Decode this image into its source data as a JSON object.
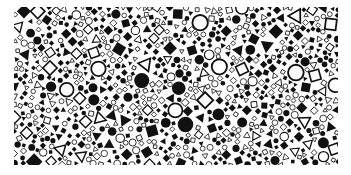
{
  "image": {
    "description": "Dense random mosaic of black geometric shapes: filled and outlined squares, circles, diamonds and triangles on white",
    "background": "#ffffff",
    "ink": "#111111",
    "area": {
      "x": 14,
      "y": 7,
      "width": 324,
      "height": 158
    },
    "shapes": [
      "square",
      "diamond",
      "circle",
      "triangle"
    ],
    "styles": [
      "filled",
      "outlined"
    ],
    "seed": 1337,
    "count": 1400,
    "size_range": [
      2.5,
      9
    ]
  }
}
